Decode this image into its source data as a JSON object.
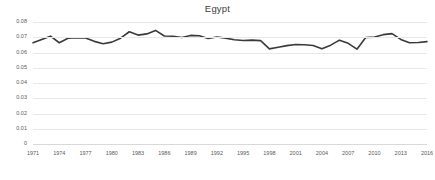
{
  "chart_data": {
    "type": "line",
    "title": "Egypt",
    "xlabel": "",
    "ylabel": "",
    "xlim": [
      1971,
      2016
    ],
    "ylim": [
      0,
      0.08
    ],
    "grid": true,
    "legend": false,
    "legend_position": "none",
    "line_color": "#3a3a3a",
    "grid_color": "#e8e8e8",
    "y_ticks": [
      "0.08",
      "0.07",
      "0.06",
      "0.05",
      "0.04",
      "0.03",
      "0.02",
      "0.01",
      "0"
    ],
    "y_tick_values": [
      0.08,
      0.07,
      0.06,
      0.05,
      0.04,
      0.03,
      0.02,
      0.01,
      0
    ],
    "x_ticks": [
      "1971",
      "1974",
      "1977",
      "1980",
      "1983",
      "1986",
      "1989",
      "1992",
      "1995",
      "1998",
      "2001",
      "2004",
      "2007",
      "2010",
      "2013",
      "2016"
    ],
    "x_tick_values": [
      1971,
      1974,
      1977,
      1980,
      1983,
      1986,
      1989,
      1992,
      1995,
      1998,
      2001,
      2004,
      2007,
      2010,
      2013,
      2016
    ],
    "series": [
      {
        "name": "Egypt",
        "x": [
          1971,
          1972,
          1973,
          1974,
          1975,
          1976,
          1977,
          1978,
          1979,
          1980,
          1981,
          1982,
          1983,
          1984,
          1985,
          1986,
          1987,
          1988,
          1989,
          1990,
          1991,
          1992,
          1993,
          1994,
          1995,
          1996,
          1997,
          1998,
          1999,
          2000,
          2001,
          2002,
          2003,
          2004,
          2005,
          2006,
          2007,
          2008,
          2009,
          2010,
          2011,
          2012,
          2013,
          2014,
          2015,
          2016
        ],
        "values": [
          0.0664,
          0.0685,
          0.0707,
          0.0664,
          0.0693,
          0.0697,
          0.0695,
          0.0673,
          0.0657,
          0.0668,
          0.0694,
          0.0736,
          0.0714,
          0.0722,
          0.0745,
          0.0708,
          0.0707,
          0.0698,
          0.0712,
          0.071,
          0.0692,
          0.0702,
          0.0694,
          0.0684,
          0.0679,
          0.0681,
          0.0678,
          0.0624,
          0.0634,
          0.0645,
          0.0652,
          0.0651,
          0.0646,
          0.0624,
          0.0648,
          0.0681,
          0.066,
          0.0622,
          0.0698,
          0.0701,
          0.0717,
          0.0724,
          0.0686,
          0.0664,
          0.0666,
          0.0671
        ]
      }
    ]
  }
}
